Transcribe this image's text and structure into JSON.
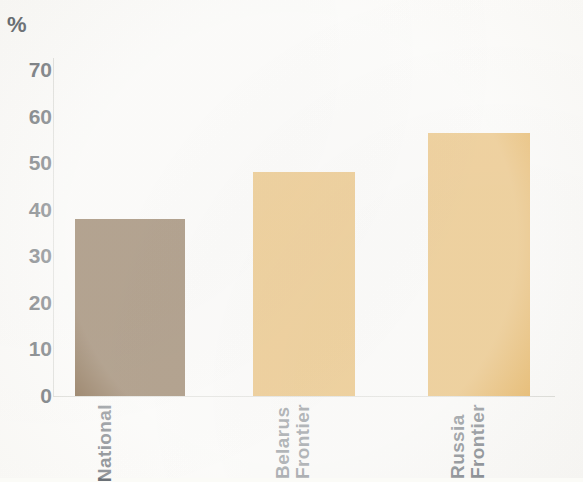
{
  "chart_data": {
    "type": "bar",
    "title": "",
    "subtitle": "",
    "xlabel": "",
    "ylabel": "%",
    "unit_label": "%",
    "categories": [
      "National",
      "Belarus Frontier",
      "Russia Frontier"
    ],
    "category_lines": [
      [
        "National"
      ],
      [
        "Belarus",
        "Frontier"
      ],
      [
        "Russia",
        "Frontier"
      ]
    ],
    "values": [
      38,
      48,
      56.5
    ],
    "series": [
      {
        "name": "Share",
        "values": [
          38,
          48,
          56.5
        ]
      }
    ],
    "ylim": [
      0,
      70
    ],
    "y_ticks": [
      0,
      10,
      20,
      30,
      40,
      50,
      60,
      70
    ],
    "y_tick_labels": [
      "0",
      "10",
      "20",
      "30",
      "40",
      "50",
      "60",
      "70"
    ],
    "grid": false,
    "legend": "none",
    "bar_colors": [
      "#6b4a24",
      "#e3a845",
      "#e3a845"
    ],
    "bars": [
      {
        "label": "National",
        "value": 38,
        "color": "#6b4a24",
        "x": 75,
        "width": 110
      },
      {
        "label": "Belarus Frontier",
        "value": 48,
        "color": "#e3a845",
        "x": 253,
        "width": 102
      },
      {
        "label": "Russia Frontier",
        "value": 56.5,
        "color": "#e3a845",
        "x": 428,
        "width": 102
      }
    ],
    "label_positions": [
      95,
      273,
      448
    ],
    "axis_color": "#d9d9d4",
    "text_color": "#5d6368",
    "background_color": "#fcfbf8"
  }
}
